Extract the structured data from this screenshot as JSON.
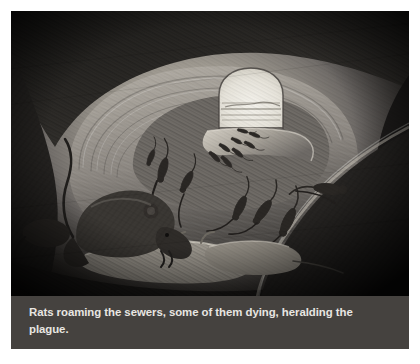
{
  "figure": {
    "caption": "Rats roaming the sewers, some of them dying, heralding the plague.",
    "alt_description": "Grayscale pencil illustration of a curving sewer tunnel with a bright arched opening in the distance; numerous rats stream out across the tunnel floor while a large rat crouches over dying rats in the foreground.",
    "medium": "pencil / charcoal drawing",
    "palette": {
      "page_background": "#ffffff",
      "caption_band": "#45423f",
      "caption_text": "#e8e6e2",
      "tunnel_dark": "#211f1d",
      "tunnel_mid": "#565250",
      "tunnel_light": "#b9b4ac",
      "opening_bright": "#eceae2",
      "rat_silhouette": "#2c2926"
    },
    "scene_elements": [
      {
        "name": "tunnel-opening",
        "label": "bright arched sewer opening"
      },
      {
        "name": "tunnel-wall",
        "label": "curving ribbed sewer wall"
      },
      {
        "name": "rat-stream",
        "label": "line of rats emerging from the opening"
      },
      {
        "name": "foreground-rat",
        "label": "large rat crouching over a dying rat"
      },
      {
        "name": "dying-rats",
        "label": "pale rats lying on their backs"
      },
      {
        "name": "scattered-rats",
        "label": "rats scattered across the tunnel floor"
      }
    ]
  }
}
